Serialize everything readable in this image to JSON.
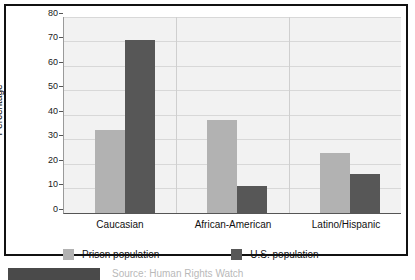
{
  "chart_data": {
    "type": "bar",
    "title": "",
    "xlabel": "",
    "ylabel": "Percentage",
    "ylim": [
      0,
      80
    ],
    "yticks": [
      0,
      10,
      20,
      30,
      40,
      50,
      60,
      70,
      80
    ],
    "grid": true,
    "legend_position": "bottom",
    "categories": [
      "Caucasian",
      "African-American",
      "Latino/Hispanic"
    ],
    "series": [
      {
        "name": "Prison population",
        "color": "#b2b2b2",
        "values": [
          34,
          38,
          24.5
        ]
      },
      {
        "name": "U.S. population",
        "color": "#575757",
        "values": [
          71,
          11,
          16
        ]
      }
    ]
  },
  "axis": {
    "y_label": "Percentage",
    "y_ticks": [
      "80",
      "70",
      "60",
      "50",
      "40",
      "30",
      "20",
      "10",
      "0"
    ],
    "x_categories": [
      "Caucasian",
      "African-American",
      "Latino/Hispanic"
    ]
  },
  "legend": {
    "items": [
      {
        "label": "Prison population",
        "color": "#b2b2b2"
      },
      {
        "label": "U.S. population",
        "color": "#575757"
      }
    ]
  },
  "caption": {
    "text": "Source: Human Rights Watch"
  },
  "colors": {
    "prison": "#b2b2b2",
    "us": "#575757",
    "plot_background": "#f2f2f2",
    "gridline": "#d8d8d8",
    "frame": "#111111"
  }
}
